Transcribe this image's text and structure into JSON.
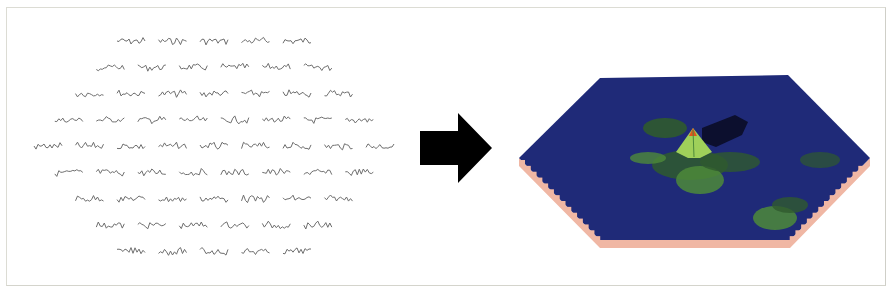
{
  "figure": {
    "left_panel": {
      "type": "sensor-waveform-grid",
      "rows": [
        5,
        6,
        7,
        8,
        9,
        8,
        7,
        6,
        5
      ],
      "trace_color": "#6e6e6e"
    },
    "arrow": {
      "direction": "right",
      "color": "#000000"
    },
    "right_panel": {
      "type": "3d-hexagonal-surface",
      "colors": {
        "base": "#1f2a78",
        "base_deep": "#141d5c",
        "green_dark": "#2f5a2e",
        "green_mid": "#4d8a3a",
        "green_light": "#9fd05a",
        "peak": "#e0541e",
        "shadow": "#0c0f2e",
        "side": "#f0b7a4"
      }
    }
  }
}
